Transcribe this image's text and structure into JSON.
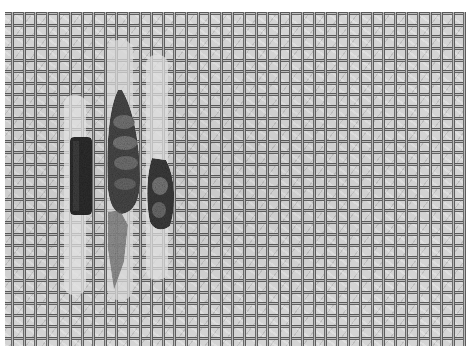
{
  "image": {
    "description": "Grayscale photograph of three larval cases resting on a woven mesh screen",
    "subjects": [
      {
        "name": "left-case",
        "shape": "rectangular dark textured case"
      },
      {
        "name": "middle-case",
        "shape": "tall segmented case with fibrous tail"
      },
      {
        "name": "right-case",
        "shape": "spindle-shaped mottled case"
      }
    ],
    "background": "woven square mesh",
    "colors": {
      "mesh_light": "#d4d4d4",
      "mesh_dark": "#5c5c5c",
      "case_dark": "#2f2f2f",
      "case_mid": "#6e6e6e",
      "border": "#ffffff"
    }
  }
}
